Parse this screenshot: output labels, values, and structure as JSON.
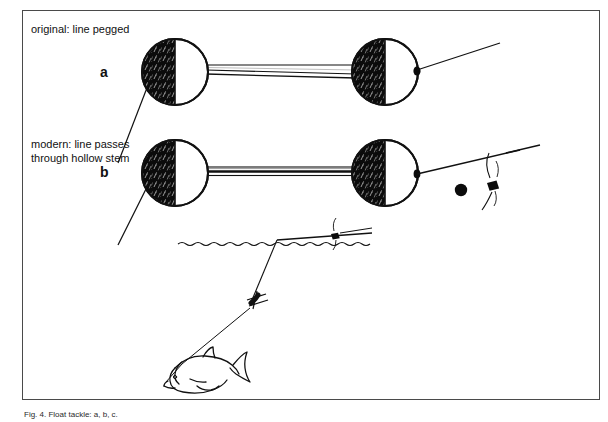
{
  "figure": {
    "background_color": "#ffffff",
    "ink_color": "#111111",
    "frame_color": "#4a4a4a",
    "caption": "Fig. 4. Float tackle: a, b, c.",
    "annotations": {
      "original_label": "original: line pegged",
      "modern_label_line1": "modern: line passes",
      "modern_label_line2": "through hollow stem",
      "item_a": "a",
      "item_b": "b"
    },
    "parts": {
      "float_body_top_left": "float-body",
      "float_body_top_right": "float-body",
      "float_body_bottom_left": "float-body",
      "float_body_bottom_right": "float-body",
      "hollow_stem_top": "float-stem",
      "hollow_stem_bottom": "float-stem",
      "line_top": "fishing-line",
      "line_bottom": "fishing-line",
      "bead": "line-bead",
      "stop_knot": "stop-knot",
      "water_surface": "water-surface-line",
      "sinker": "sinker-weight",
      "fish": "hooked-fish"
    }
  }
}
